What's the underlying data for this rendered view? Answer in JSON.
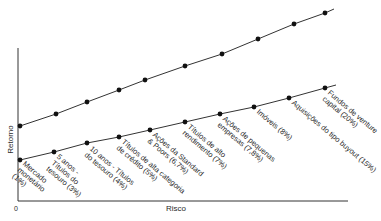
{
  "chart_data": {
    "type": "line",
    "title": "",
    "xlabel": "Risco",
    "ylabel": "Retorno",
    "origin_label": "0",
    "grid": false,
    "legend": null,
    "series": [
      {
        "name": "upper-line",
        "points": [
          [
            20,
            126
          ],
          [
            56,
            114
          ],
          [
            87,
            102
          ],
          [
            119,
            90
          ],
          [
            145,
            80
          ],
          [
            185,
            66
          ],
          [
            222,
            54
          ],
          [
            258,
            39
          ],
          [
            294,
            24
          ],
          [
            325,
            13
          ]
        ],
        "line_end": [
          334,
          9
        ]
      },
      {
        "name": "lower-line",
        "points": [
          [
            20,
            160
          ],
          [
            54,
            152
          ],
          [
            87,
            143
          ],
          [
            119,
            137
          ],
          [
            150,
            130
          ],
          [
            185,
            122
          ],
          [
            220,
            114
          ],
          [
            254,
            107
          ],
          [
            289,
            98
          ],
          [
            325,
            88
          ]
        ],
        "line_end": [
          336,
          85
        ]
      }
    ],
    "annotations": [
      {
        "text": "Mercado\nmonetário\n(1%)",
        "x": 26,
        "y": 160
      },
      {
        "text": "5 anos -\nTítulos do\ntesouro (3%)",
        "x": 60,
        "y": 153
      },
      {
        "text": "10 anos - Títulos\ndo tesouro (4%)",
        "x": 93,
        "y": 145
      },
      {
        "text": "Títulos de alta categoria\nde crédito (5%)",
        "x": 125,
        "y": 138
      },
      {
        "text": "Ações da Standard\n& Poors (6,7%)",
        "x": 156,
        "y": 131
      },
      {
        "text": "Títulos de alto\nrendimento (7%)",
        "x": 191,
        "y": 123
      },
      {
        "text": "Ações de pequenas\nempresas (7,8%)",
        "x": 226,
        "y": 115
      },
      {
        "text": "Imóveis (8%)",
        "x": 260,
        "y": 108
      },
      {
        "text": "Aquisições do tipo buyout (15%)",
        "x": 295,
        "y": 99
      },
      {
        "text": "Fundos de venture\ncapital (20%)",
        "x": 331,
        "y": 89
      }
    ],
    "axes": {
      "x_start": 18,
      "x_end": 348,
      "y_axis_top": 48,
      "baseline_y": 201
    }
  }
}
